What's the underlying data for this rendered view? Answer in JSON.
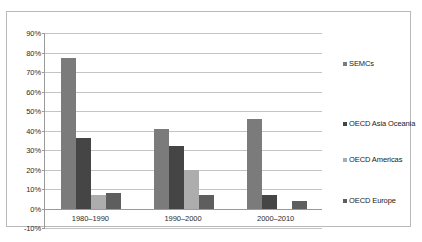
{
  "chart_data": {
    "type": "bar",
    "title": "",
    "subtitle": "",
    "xlabel": "",
    "ylabel": "",
    "categories": [
      "1980–1990",
      "1990–2000",
      "2000–2010"
    ],
    "series": [
      {
        "name": "SEMCs",
        "color": "#7b7b7b",
        "values": [
          77,
          41,
          46
        ]
      },
      {
        "name": "OECD Asia Oceania",
        "color": "#454545",
        "values": [
          36,
          32,
          7
        ]
      },
      {
        "name": "OECD Americas",
        "color": "#adadad",
        "values": [
          7,
          20,
          0
        ]
      },
      {
        "name": "OECD Europe",
        "color": "#5e5e5e",
        "values": [
          8,
          7,
          4
        ]
      }
    ],
    "ylim": [
      -10,
      90
    ],
    "ytick_step": 10,
    "ytick_labels": [
      "90%",
      "80%",
      "70%",
      "60%",
      "50%",
      "40%",
      "30%",
      "20%",
      "10%",
      "0%",
      "-10%"
    ],
    "ytick_values": [
      90,
      80,
      70,
      60,
      50,
      40,
      30,
      20,
      10,
      0,
      -10
    ],
    "grid": true,
    "legend_position": "right",
    "value_suffix": "%"
  },
  "colors": {
    "grid": "#c4c4c4",
    "axis": "#9a9a9a",
    "frame": "#b9b9b9",
    "text": "#2a2a2a",
    "background": "#ffffff"
  }
}
